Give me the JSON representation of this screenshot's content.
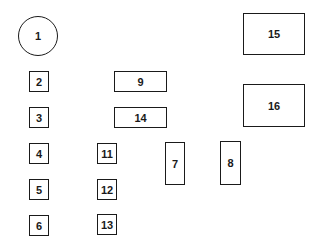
{
  "diagram": {
    "type": "fuse/relay box layout",
    "stroke_color": "#1a1a1a",
    "background": "#ffffff",
    "components": [
      {
        "id": "c1",
        "label": "1",
        "shape": "circle",
        "x": 18,
        "y": 16,
        "w": 40,
        "h": 40
      },
      {
        "id": "c2",
        "label": "2",
        "shape": "rect",
        "x": 29,
        "y": 71,
        "w": 20,
        "h": 21
      },
      {
        "id": "c3",
        "label": "3",
        "shape": "rect",
        "x": 29,
        "y": 107,
        "w": 20,
        "h": 21
      },
      {
        "id": "c4",
        "label": "4",
        "shape": "rect",
        "x": 29,
        "y": 143,
        "w": 20,
        "h": 21
      },
      {
        "id": "c5",
        "label": "5",
        "shape": "rect",
        "x": 29,
        "y": 179,
        "w": 20,
        "h": 21
      },
      {
        "id": "c6",
        "label": "6",
        "shape": "rect",
        "x": 29,
        "y": 215,
        "w": 20,
        "h": 21
      },
      {
        "id": "c7",
        "label": "7",
        "shape": "rect",
        "x": 165,
        "y": 142,
        "w": 20,
        "h": 43
      },
      {
        "id": "c8",
        "label": "8",
        "shape": "rect",
        "x": 220,
        "y": 141,
        "w": 21,
        "h": 44
      },
      {
        "id": "c9",
        "label": "9",
        "shape": "rect",
        "x": 114,
        "y": 71,
        "w": 53,
        "h": 21
      },
      {
        "id": "c11",
        "label": "11",
        "shape": "rect",
        "x": 97,
        "y": 143,
        "w": 20,
        "h": 21
      },
      {
        "id": "c12",
        "label": "12",
        "shape": "rect",
        "x": 97,
        "y": 179,
        "w": 20,
        "h": 21
      },
      {
        "id": "c13",
        "label": "13",
        "shape": "rect",
        "x": 97,
        "y": 214,
        "w": 20,
        "h": 21
      },
      {
        "id": "c14",
        "label": "14",
        "shape": "rect",
        "x": 114,
        "y": 107,
        "w": 53,
        "h": 21
      },
      {
        "id": "c15",
        "label": "15",
        "shape": "rect",
        "x": 243,
        "y": 13,
        "w": 62,
        "h": 42
      },
      {
        "id": "c16",
        "label": "16",
        "shape": "rect",
        "x": 243,
        "y": 84,
        "w": 62,
        "h": 43
      }
    ]
  }
}
